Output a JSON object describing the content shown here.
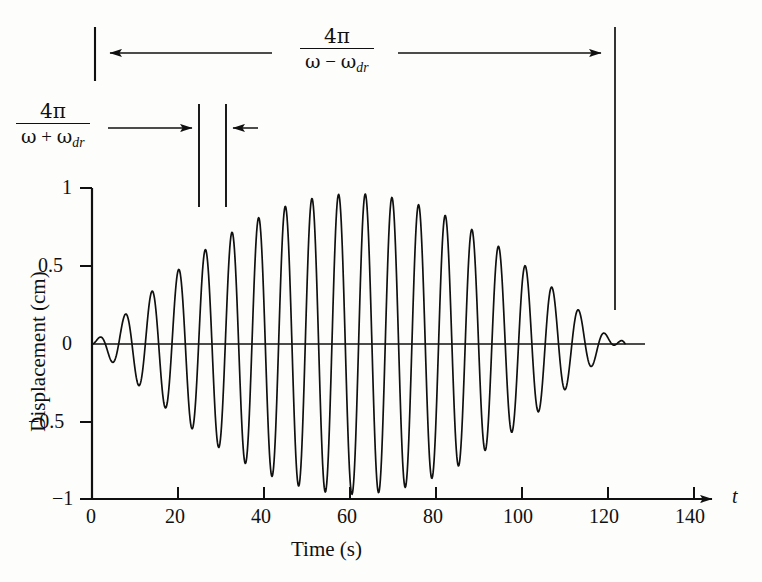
{
  "figure": {
    "background_color": "#fdfdfb",
    "line_color": "#101010"
  },
  "axes": {
    "x_axis_variable": "t",
    "x_title": "Time (s)",
    "y_title": "Displacement (cm)",
    "x_ticks": [
      "0",
      "20",
      "40",
      "60",
      "80",
      "100",
      "120",
      "140"
    ],
    "y_ticks": [
      "1",
      "0.5",
      "0",
      "−0.5",
      "−1"
    ]
  },
  "annotations": {
    "beat_period": {
      "numerator": "4π",
      "denominator_omega": "ω",
      "denominator_operator": "−",
      "denominator_omega_dr": "ω",
      "denominator_sub": "dr",
      "label_plain": "4π / (ω − ωdr)"
    },
    "carrier_period": {
      "numerator": "4π",
      "denominator_omega": "ω",
      "denominator_operator": "+",
      "denominator_omega_dr": "ω",
      "denominator_sub": "dr",
      "label_plain": "4π / (ω + ωdr)"
    }
  },
  "chart_data": {
    "type": "line",
    "title": "",
    "xlabel": "Time (s)",
    "ylabel": "Displacement (cm)",
    "xlim": [
      0,
      145
    ],
    "ylim": [
      -1,
      1
    ],
    "grid": false,
    "legend": null,
    "x_ticks": [
      0,
      20,
      40,
      60,
      80,
      100,
      120,
      140
    ],
    "y_ticks": [
      -1,
      -0.5,
      0,
      0.5,
      1
    ],
    "model": {
      "form": "y(t) = A * sin(pi*(t - t0)/T_beat) * sin(2*pi*(t - t0)/T_carrier)",
      "amplitude": 0.97,
      "carrier_period_s": 6.2,
      "beat_period_s": 122,
      "t_start": 0,
      "t_end": 124,
      "node_t": 62
    },
    "envelope_peaks": [
      {
        "t": 31,
        "value": 0.97
      },
      {
        "t": 93,
        "value": 0.97
      }
    ],
    "envelope_nodes": [
      {
        "t": 0,
        "value": 0
      },
      {
        "t": 62,
        "value": 0
      },
      {
        "t": 124,
        "value": 0
      }
    ],
    "series": [
      {
        "name": "displacement",
        "x": [
          0,
          1.5,
          3.1,
          4.6,
          6.2,
          7.8,
          9.3,
          10.9,
          12.4,
          14.0,
          15.5,
          17.1,
          18.6,
          20.2,
          21.7,
          23.3,
          24.8,
          26.4,
          27.9,
          29.5,
          31.0,
          32.6,
          34.1,
          35.7,
          37.2,
          38.8,
          40.3,
          41.9,
          43.4,
          45.0,
          46.5,
          48.1,
          49.6,
          51.2,
          52.7,
          54.3,
          55.8,
          57.4,
          58.9,
          60.5,
          62.0,
          63.6,
          65.1,
          66.7,
          68.2,
          69.8,
          71.3,
          72.9,
          74.4,
          76.0,
          77.5,
          79.1,
          80.6,
          82.2,
          83.7,
          85.3,
          86.8,
          88.4,
          89.9,
          91.5,
          93.0,
          94.6,
          96.1,
          97.7,
          99.2,
          100.8,
          102.3,
          103.9,
          105.4,
          107.0,
          108.5,
          110.1,
          111.6,
          113.2,
          114.7,
          116.3,
          117.8,
          119.4,
          120.9,
          122.5,
          124.0
        ],
        "y": [
          0,
          0.038,
          0,
          -0.077,
          0,
          0.114,
          0,
          -0.15,
          0,
          0.185,
          0,
          -0.219,
          0,
          0.252,
          0,
          -0.283,
          0,
          0.312,
          0,
          -0.339,
          0,
          0.364,
          0,
          -0.387,
          0,
          0.407,
          0,
          -0.424,
          0,
          0.438,
          0,
          -0.45,
          0,
          0.458,
          0,
          -0.463,
          0,
          0.465,
          0,
          -0.464,
          0,
          0.459,
          0,
          -0.452,
          0,
          0.441,
          0,
          -0.427,
          0,
          0.411,
          0,
          -0.391,
          0,
          0.369,
          0,
          -0.344,
          0,
          0.317,
          0,
          -0.288,
          0,
          0.257,
          0,
          -0.224,
          0,
          0.19,
          0,
          -0.155,
          0,
          0.119,
          0,
          -0.082,
          0,
          0.045,
          0,
          -0.008,
          0,
          0.03,
          0,
          -0.012,
          0
        ],
        "note": "Sampled at carrier quarter-periods; full curve rendered analytically in SVG."
      }
    ]
  },
  "geometry": {
    "x_origin_px": 92,
    "x_px_per_second": 4.3,
    "y_zero_px": 344,
    "y_px_per_unit": 155,
    "wave_end_t": 124,
    "marker_line_1_t": 25,
    "marker_line_2_t": 31
  }
}
